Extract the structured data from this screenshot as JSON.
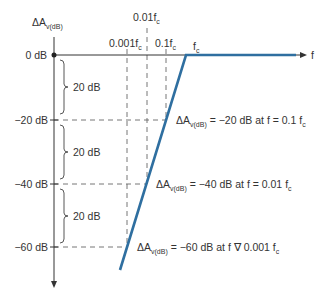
{
  "diagram": {
    "y_axis_label": {
      "main": "ΔA",
      "sub": "v(dB)"
    },
    "x_axis_label": "f",
    "colors": {
      "response_line": "#2f6fa0",
      "axis": "#333333",
      "dashed": "#666666"
    },
    "y_ticks": [
      {
        "label": "0 dB",
        "y": 55
      },
      {
        "label": "−20 dB",
        "y": 120
      },
      {
        "label": "−40 dB",
        "y": 184
      },
      {
        "label": "−60 dB",
        "y": 247
      }
    ],
    "x_markers": [
      {
        "label_main": "0.001f",
        "label_sub": "c",
        "x": 127
      },
      {
        "label_main": "0.01f",
        "label_sub": "c",
        "x": 147
      },
      {
        "label_main": "0.1f",
        "label_sub": "c",
        "x": 166
      },
      {
        "label_main": "f",
        "label_sub": "c",
        "x": 186
      }
    ],
    "brace_labels": [
      "20 dB",
      "20 dB",
      "20 dB"
    ],
    "annotations": [
      {
        "prefix": "ΔA",
        "sub": "v(dB)",
        "text": " = −20 dB at f = 0.1 f",
        "tail_sub": "c"
      },
      {
        "prefix": "ΔA",
        "sub": "v(dB)",
        "text": " = −40 dB at f = 0.01 f",
        "tail_sub": "c"
      },
      {
        "prefix": "ΔA",
        "sub": "v(dB)",
        "text": " = −60 dB at f ∇ 0.001 f",
        "tail_sub": "c"
      }
    ]
  }
}
